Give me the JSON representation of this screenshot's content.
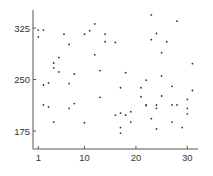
{
  "chart_data": {
    "type": "scatter",
    "title": "",
    "xlabel": "",
    "ylabel": "",
    "xlim": [
      0.5,
      32
    ],
    "ylim": [
      152,
      360
    ],
    "grid": false,
    "legend": null,
    "x_ticks": [
      1,
      10,
      20,
      30
    ],
    "y_ticks": [
      175,
      250,
      325
    ],
    "x_tick_labels": [
      "1",
      "10",
      "20",
      "30"
    ],
    "y_tick_labels": [
      "175",
      "250",
      "325"
    ],
    "series": [
      {
        "name": "points",
        "color": "#333333",
        "points": [
          [
            1,
            322
          ],
          [
            2,
            322
          ],
          [
            1,
            312
          ],
          [
            6,
            316
          ],
          [
            10,
            316
          ],
          [
            11,
            321
          ],
          [
            12,
            331
          ],
          [
            14,
            316
          ],
          [
            7,
            301
          ],
          [
            16,
            304
          ],
          [
            14,
            305
          ],
          [
            5,
            282
          ],
          [
            4,
            274
          ],
          [
            4,
            267
          ],
          [
            5,
            261
          ],
          [
            2,
            242
          ],
          [
            3,
            245
          ],
          [
            7,
            244
          ],
          [
            8,
            258
          ],
          [
            12,
            286
          ],
          [
            13,
            263
          ],
          [
            2,
            213
          ],
          [
            3,
            210
          ],
          [
            4,
            188
          ],
          [
            7,
            208
          ],
          [
            8,
            215
          ],
          [
            10,
            187
          ],
          [
            13,
            224
          ],
          [
            16,
            198
          ],
          [
            17,
            201
          ],
          [
            18,
            198
          ],
          [
            19,
            203
          ],
          [
            19,
            188
          ],
          [
            17,
            180
          ],
          [
            17,
            172
          ],
          [
            17,
            238
          ],
          [
            18,
            260
          ],
          [
            21,
            238
          ],
          [
            22,
            249
          ],
          [
            21,
            225
          ],
          [
            22,
            213
          ],
          [
            22,
            212
          ],
          [
            23,
            193
          ],
          [
            24,
            213
          ],
          [
            24,
            208
          ],
          [
            24,
            178
          ],
          [
            25,
            226
          ],
          [
            25,
            255
          ],
          [
            25,
            289
          ],
          [
            23,
            344
          ],
          [
            23,
            308
          ],
          [
            24,
            317
          ],
          [
            26,
            305
          ],
          [
            28,
            335
          ],
          [
            27,
            240
          ],
          [
            27,
            213
          ],
          [
            28,
            213
          ],
          [
            27,
            188
          ],
          [
            29,
            180
          ],
          [
            30,
            221
          ],
          [
            30,
            208
          ],
          [
            30,
            200
          ],
          [
            31,
            234
          ],
          [
            31,
            273
          ]
        ]
      }
    ]
  }
}
